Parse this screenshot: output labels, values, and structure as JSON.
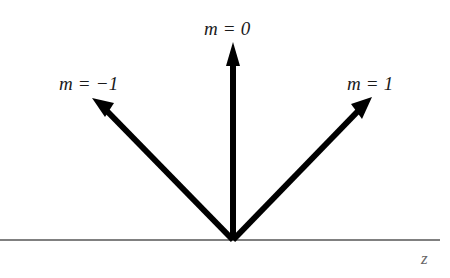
{
  "figure": {
    "kind": "vector-diagram",
    "background_color": "#ffffff",
    "width": 450,
    "height": 278
  },
  "colors": {
    "arrow": "#000000",
    "axis_line": "#808080",
    "label_text": "#1a1a1a",
    "axis_label_text": "#666666",
    "faint_fragment": "#d8d8d8"
  },
  "origin": {
    "x": 233,
    "y": 240
  },
  "axis": {
    "name": "z-axis",
    "label": "z",
    "x_start": 0,
    "x_end": 440,
    "y": 240,
    "stroke_width": 2,
    "color": "#808080",
    "label_x": 425,
    "label_y": 262
  },
  "arrows": [
    {
      "id": "arrow-m-neg1",
      "order": -1,
      "label": "m = −1",
      "tip_x": 92,
      "tip_y": 98,
      "angle_deg_from_axis": 134,
      "shaft_width": 6,
      "label_x": 59,
      "label_y": 74
    },
    {
      "id": "arrow-m-0",
      "order": 0,
      "label": "m = 0",
      "tip_x": 233,
      "tip_y": 42,
      "angle_deg_from_axis": 90,
      "shaft_width": 6,
      "label_x": 204,
      "label_y": 19
    },
    {
      "id": "arrow-m-pos1",
      "order": 1,
      "label": "m = 1",
      "tip_x": 372,
      "tip_y": 97,
      "angle_deg_from_axis": 46,
      "shaft_width": 6,
      "label_x": 347,
      "label_y": 74
    }
  ],
  "top_fragment": {
    "text": " ",
    "note_visible_as": "faint cropped glyph descenders at top edge"
  }
}
